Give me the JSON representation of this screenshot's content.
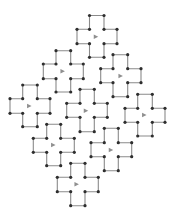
{
  "diagram": {
    "colors": {
      "background": "#ffffff",
      "outline": "#8a8a8a",
      "vertex": "#2e2e2e",
      "marker": "#8f8f8f"
    },
    "crosses": [
      {
        "id": 1,
        "xs": [
          77,
          89.5,
          104,
          117
        ],
        "ys": [
          15.5,
          29.3,
          43.7,
          57.3
        ],
        "marker": [
          96,
          36.7
        ]
      },
      {
        "id": 2,
        "xs": [
          43.3,
          56,
          70.7,
          83.3
        ],
        "ys": [
          50.7,
          64,
          78.7,
          92
        ],
        "marker": [
          62.7,
          71.3
        ]
      },
      {
        "id": 3,
        "xs": [
          100.7,
          113,
          127.7,
          141
        ],
        "ys": [
          54.7,
          68.7,
          82.7,
          96.7
        ],
        "marker": [
          120.7,
          76
        ]
      },
      {
        "id": 4,
        "xs": [
          10,
          22.7,
          37.3,
          50
        ],
        "ys": [
          85,
          98.7,
          113.3,
          126.7
        ],
        "marker": [
          29.3,
          106
        ]
      },
      {
        "id": 5,
        "xs": [
          66.7,
          80,
          94.3,
          107.3
        ],
        "ys": [
          89.3,
          103.3,
          117.3,
          131.7
        ],
        "marker": [
          86,
          110.7
        ]
      },
      {
        "id": 6,
        "xs": [
          125,
          137.7,
          152.3,
          165
        ],
        "ys": [
          94.3,
          108.3,
          122.3,
          136
        ],
        "marker": [
          144.3,
          115
        ]
      },
      {
        "id": 7,
        "xs": [
          33.3,
          46.7,
          60.7,
          74.3
        ],
        "ys": [
          124.3,
          138.3,
          152.3,
          165.7
        ],
        "marker": [
          53.3,
          145
        ]
      },
      {
        "id": 8,
        "xs": [
          91,
          104.3,
          118.3,
          131.7
        ],
        "ys": [
          128.3,
          142.7,
          156.7,
          170.7
        ],
        "marker": [
          111,
          150
        ]
      },
      {
        "id": 9,
        "xs": [
          57.3,
          70.7,
          85,
          98.3
        ],
        "ys": [
          163.3,
          177.3,
          191.7,
          205.7
        ],
        "marker": [
          76.7,
          184.3
        ]
      }
    ],
    "vertex_radius": 1.6,
    "marker_size": 4.5
  }
}
